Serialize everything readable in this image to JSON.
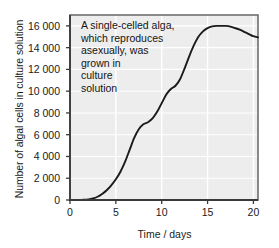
{
  "chart_data": {
    "type": "line",
    "title": "",
    "xlabel": "Time / days",
    "ylabel": "Number of algal cells in culture solution",
    "xlim": [
      0,
      20.5
    ],
    "ylim": [
      0,
      17000
    ],
    "xticks": [
      0,
      5,
      10,
      15,
      20
    ],
    "xtick_labels": [
      "0",
      "5",
      "10",
      "15",
      "20"
    ],
    "yticks": [
      0,
      2000,
      4000,
      6000,
      8000,
      10000,
      12000,
      14000,
      16000
    ],
    "ytick_labels": [
      "0",
      "2 000",
      "4 000",
      "6 000",
      "8 000",
      "10 000",
      "12 000",
      "14 000",
      "16 000"
    ],
    "grid": true,
    "grid_color": "#ffffff",
    "plot_background": "#ededed",
    "legend": null,
    "series": [
      {
        "name": "algal cell growth",
        "color": "#1a1a1a",
        "x": [
          0,
          0.5,
          1,
          1.5,
          2,
          2.5,
          3,
          3.5,
          4,
          4.5,
          5,
          5.5,
          6,
          6.5,
          7,
          7.5,
          8,
          8.5,
          9,
          9.5,
          10,
          10.5,
          11,
          11.5,
          12,
          12.5,
          13,
          13.5,
          14,
          14.5,
          15,
          15.5,
          16,
          16.5,
          17,
          17.5,
          18,
          18.5,
          19,
          19.5,
          20,
          20.5
        ],
        "y": [
          0,
          0,
          0,
          20,
          60,
          140,
          300,
          560,
          900,
          1350,
          1900,
          2600,
          3500,
          4600,
          5700,
          6500,
          6950,
          7150,
          7500,
          8100,
          8900,
          9700,
          10200,
          10500,
          11100,
          12100,
          13200,
          14200,
          15000,
          15500,
          15800,
          15950,
          16000,
          16000,
          16000,
          15930,
          15800,
          15650,
          15450,
          15250,
          15050,
          14950
        ]
      }
    ],
    "annotations": [
      {
        "name": "experiment-description",
        "lines": [
          "A single-celled alga,",
          "which reproduces",
          "asexually, was",
          "grown in",
          "culture",
          "solution"
        ]
      }
    ]
  }
}
